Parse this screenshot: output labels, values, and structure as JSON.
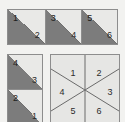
{
  "figure": {
    "colors": {
      "dark_fill": "#7c7c7c",
      "light_fill": "#e9e9e7",
      "outline": "#8d8d8d",
      "label_text": "#2b2b2b",
      "background": "#f2f2f0"
    },
    "top_strip": {
      "name": "row of three diagonally split squares",
      "squares": [
        {
          "upper_label": "1",
          "lower_label": "2"
        },
        {
          "upper_label": "3",
          "lower_label": "4"
        },
        {
          "upper_label": "5",
          "lower_label": "6"
        }
      ]
    },
    "left_stack": {
      "name": "column of two diagonally split squares",
      "squares": [
        {
          "upper_label": "4",
          "lower_label": "3"
        },
        {
          "upper_label": "2",
          "lower_label": "1"
        }
      ]
    },
    "sector_square": {
      "name": "square divided into six triangular sectors",
      "sector_count": 6,
      "labels": [
        "1",
        "2",
        "3",
        "4",
        "5",
        "6"
      ],
      "sectors": [
        {
          "label": "1",
          "position": "top-left",
          "cx": 31,
          "cy": 18
        },
        {
          "label": "2",
          "position": "top-right",
          "cx": 56,
          "cy": 18
        },
        {
          "label": "3",
          "position": "right",
          "cx": 66,
          "cy": 38
        },
        {
          "label": "4",
          "position": "left",
          "cx": 18,
          "cy": 38
        },
        {
          "label": "5",
          "position": "bottom-left",
          "cx": 31,
          "cy": 58
        },
        {
          "label": "6",
          "position": "bottom-right",
          "cx": 56,
          "cy": 58
        }
      ]
    }
  }
}
